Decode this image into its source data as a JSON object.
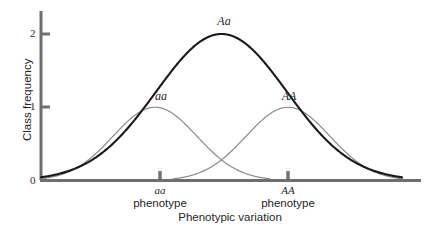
{
  "chart_data": {
    "type": "line",
    "title": "",
    "xlabel": "Phenotypic variation",
    "ylabel": "Class frequency",
    "ylim": [
      0,
      2.15
    ],
    "xlim": [
      0,
      10
    ],
    "grid": false,
    "legend_position": "inline-curve-labels",
    "y_ticks": [
      "0",
      "1",
      "2"
    ],
    "y_tick_values": [
      0,
      1,
      2
    ],
    "x_tick_labels": [
      "aa",
      "AA"
    ],
    "x_tick_values": [
      3.0,
      6.5
    ],
    "series": [
      {
        "name": "Aa",
        "label": "Aa",
        "color": "#1a1a1a",
        "line_width": 2.1,
        "peak_x": 4.75,
        "peak_y": 2.0,
        "sigma": 1.72,
        "description": "sum of aa and AA distributions, heterozygote total class frequency"
      },
      {
        "name": "aa",
        "label": "aa",
        "color": "#8a8a8a",
        "line_width": 1.2,
        "peak_x": 3.0,
        "peak_y": 1.0,
        "sigma": 1.1,
        "description": "aa homozygote distribution"
      },
      {
        "name": "AA",
        "label": "AA",
        "color": "#8a8a8a",
        "line_width": 1.2,
        "peak_x": 6.5,
        "peak_y": 1.0,
        "sigma": 1.1,
        "description": "AA homozygote distribution"
      }
    ],
    "annotations": [
      {
        "text": "Aa",
        "x": 4.75,
        "y": 2.12,
        "italic": true
      },
      {
        "text": "aa",
        "x": 3.0,
        "y": 1.14,
        "italic": true
      },
      {
        "text": "AA",
        "x": 6.5,
        "y": 1.14,
        "italic": true
      }
    ],
    "axis_colors": {
      "spine": "#6e6e6e",
      "tick": "#6e6e6e",
      "main_curve": "#1a1a1a",
      "sub_curve": "#8a8a8a"
    }
  },
  "axes": {
    "y_axis_title": "Class frequency",
    "x_axis_title": "Phenotypic variation",
    "y_tick_0": "0",
    "y_tick_1": "1",
    "y_tick_2": "2"
  },
  "curve_labels": {
    "main": "Aa",
    "left": "aa",
    "right": "AA"
  },
  "categories": [
    {
      "genotype": "aa",
      "word": "phenotype"
    },
    {
      "genotype": "AA",
      "word": "phenotype"
    }
  ]
}
